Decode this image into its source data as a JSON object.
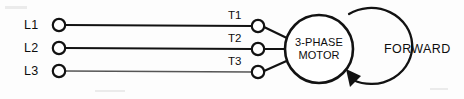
{
  "diagram": {
    "type": "electrical-schematic",
    "background_color": "#fdfdfd",
    "line_color": "#121212",
    "canvas": {
      "width": 464,
      "height": 99
    }
  },
  "supply_terminals": [
    {
      "label": "L1",
      "label_x": 24,
      "label_y": 29,
      "node_cx": 59,
      "node_cy": 25,
      "node_r": 6.2
    },
    {
      "label": "L2",
      "label_x": 24,
      "label_y": 52,
      "node_cx": 59,
      "node_cy": 48,
      "node_r": 6.2
    },
    {
      "label": "L3",
      "label_x": 24,
      "label_y": 75,
      "node_cx": 59,
      "node_cy": 71,
      "node_r": 6.2
    }
  ],
  "motor_terminals": [
    {
      "label": "T1",
      "label_x": 228,
      "label_y": 19,
      "node_cx": 258,
      "node_cy": 26,
      "node_r": 6.2
    },
    {
      "label": "T2",
      "label_x": 228,
      "label_y": 42,
      "node_cx": 258,
      "node_cy": 49,
      "node_r": 6.2
    },
    {
      "label": "T3",
      "label_x": 228,
      "label_y": 65,
      "node_cx": 258,
      "node_cy": 72,
      "node_r": 6.2
    }
  ],
  "bus_lines": [
    {
      "name": "L1-to-T1",
      "x1": 65,
      "y1": 25,
      "x2": 252,
      "y2": 26,
      "weight": "normal"
    },
    {
      "name": "L2-to-T2",
      "x1": 65,
      "y1": 48,
      "x2": 252,
      "y2": 49,
      "weight": "normal"
    },
    {
      "name": "L3-to-T3",
      "x1": 65,
      "y1": 71,
      "x2": 252,
      "y2": 72,
      "weight": "faint"
    }
  ],
  "motor_leads": [
    {
      "name": "lead-t1",
      "x1": 264,
      "y1": 27,
      "x2": 290,
      "y2": 40
    },
    {
      "name": "lead-t2",
      "x1": 264,
      "y1": 49,
      "x2": 287,
      "y2": 49
    },
    {
      "name": "lead-t3",
      "x1": 264,
      "y1": 71,
      "x2": 290,
      "y2": 59
    }
  ],
  "motor": {
    "cx": 319,
    "cy": 49,
    "r": 34,
    "label_line1": "3-PHASE",
    "label_line2": "MOTOR",
    "label1_y": 46,
    "label2_y": 59
  },
  "rotation_indicator": {
    "label": "FORWARD",
    "label_x": 384,
    "label_y": 53,
    "direction": "clockwise",
    "arc_path": "M 349 14 A 40 38 0 1 1 352 81",
    "arrow_head_points": "352,86 345,70 360,75"
  }
}
